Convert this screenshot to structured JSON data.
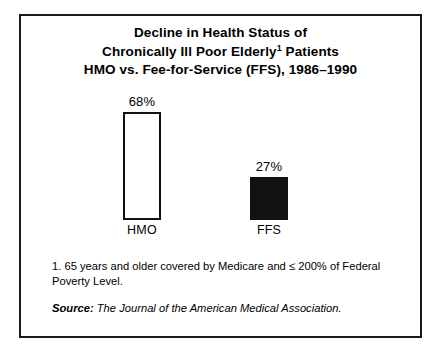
{
  "chart_data": {
    "type": "bar",
    "title_lines": [
      "Decline in Health Status of",
      "Chronically Ill Poor Elderly",
      "HMO vs. Fee-for-Service (FFS), 1986–1990"
    ],
    "title_line2_prefix": "Chronically Ill Poor Elderly",
    "title_line2_superscript": "1",
    "title_line2_suffix": " Patients",
    "categories": [
      "HMO",
      "FFS"
    ],
    "values": [
      68,
      27
    ],
    "value_labels": [
      "68%",
      "27%"
    ],
    "xlabel": "",
    "ylabel": "",
    "ylim": [
      0,
      68
    ],
    "grid": false,
    "legend": "none",
    "bar_styles": [
      "outlined-white",
      "solid-black"
    ],
    "units": "percent"
  },
  "footnote": {
    "text": "1. 65 years and older covered by Medicare and ≤ 200% of Federal Poverty Level."
  },
  "source": {
    "label": "Source:",
    "text": " The Journal of the American Medical Association."
  },
  "colors": {
    "frame": "#1a1a1a",
    "bar_fill_ffs": "#111111",
    "bar_outline_hmo": "#111111",
    "bar_fill_hmo": "#ffffff",
    "text": "#000000",
    "background": "#ffffff"
  }
}
